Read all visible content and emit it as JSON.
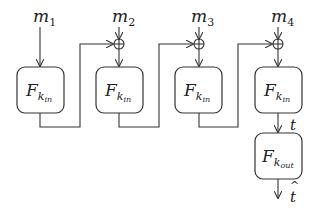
{
  "diagram": {
    "type": "block-diagram",
    "inputs": [
      {
        "label": "m",
        "sub": "1"
      },
      {
        "label": "m",
        "sub": "2"
      },
      {
        "label": "m",
        "sub": "3"
      },
      {
        "label": "m",
        "sub": "4"
      }
    ],
    "blocks": [
      {
        "label": "F",
        "sub": "k",
        "subsub": "in"
      },
      {
        "label": "F",
        "sub": "k",
        "subsub": "in"
      },
      {
        "label": "F",
        "sub": "k",
        "subsub": "in"
      },
      {
        "label": "F",
        "sub": "k",
        "subsub": "in"
      },
      {
        "label": "F",
        "sub": "k",
        "subsub": "out"
      }
    ],
    "xor_symbol": "⊕",
    "intermediate_output": "t",
    "final_output": "t̂",
    "final_output_base": "t",
    "final_output_hat": "^"
  }
}
